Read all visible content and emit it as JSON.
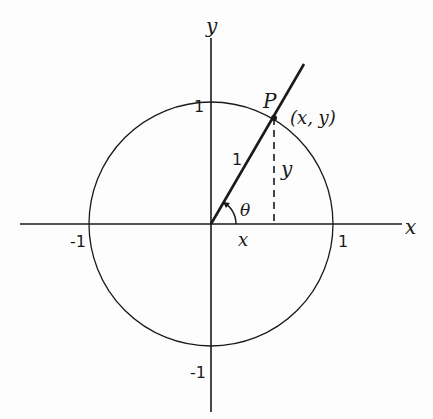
{
  "diagram": {
    "axes": {
      "x_label": "x",
      "y_label": "y"
    },
    "ticks": {
      "x_pos": "1",
      "x_neg": "-1",
      "y_pos": "1",
      "y_neg": "-1"
    },
    "point": {
      "name": "P",
      "coords": "(x, y)"
    },
    "segments": {
      "radius_label": "1",
      "vertical_label": "y",
      "horizontal_label": "x"
    },
    "angle": {
      "label": "θ"
    },
    "colors": {
      "stroke": "#1a1a1a",
      "background": "#fdfdfd"
    }
  }
}
